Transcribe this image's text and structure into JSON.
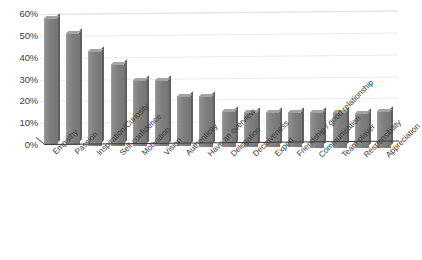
{
  "chart_data": {
    "type": "bar",
    "title": "",
    "subtitle": "",
    "xlabel": "",
    "ylabel": "",
    "ylim": [
      0,
      60
    ],
    "ytick_labels": [
      "60%",
      "50%",
      "40%",
      "30%",
      "20%",
      "10%",
      "0%"
    ],
    "ytick_values": [
      60,
      50,
      40,
      30,
      20,
      10,
      0
    ],
    "grid": true,
    "legend": false,
    "legend_position": "none",
    "bar_color": "#7e7e7e",
    "categories": [
      "Empathy",
      "Passion",
      "Inspiration/Curiosity",
      "Self-confidence",
      "Motivation",
      "Vision",
      "Authenticity",
      "Have an overview",
      "Delegation",
      "Decisiveness",
      "Expert",
      "Friendship / good relationship",
      "Communication",
      "Team player",
      "Responsibility",
      "Appreciation"
    ],
    "values": [
      58,
      51,
      43,
      37,
      30,
      30,
      23,
      23,
      16,
      16,
      16,
      16,
      16,
      16,
      16,
      17
    ]
  }
}
